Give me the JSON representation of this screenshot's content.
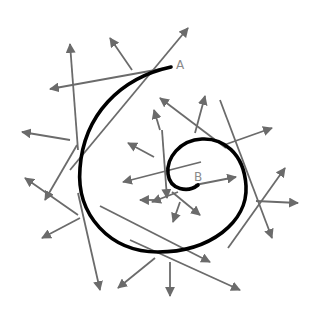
{
  "diagram": {
    "title": "",
    "labels": {
      "start": "A",
      "end": "B"
    },
    "colors": {
      "curve": "#000000",
      "vector": "#6b6b6b",
      "label": "#8a8a8a",
      "background": "#ffffff"
    },
    "curve": {
      "name": "spiral",
      "from": "A",
      "to": "B"
    },
    "vectors": [
      {
        "id": "v1",
        "kind": "tangent"
      },
      {
        "id": "v2",
        "kind": "normal"
      },
      {
        "id": "v3",
        "kind": "tangent"
      },
      {
        "id": "v4",
        "kind": "normal"
      },
      {
        "id": "v5",
        "kind": "normal"
      },
      {
        "id": "v6",
        "kind": "tangent"
      },
      {
        "id": "v7",
        "kind": "normal"
      },
      {
        "id": "v8",
        "kind": "tangent"
      },
      {
        "id": "v9",
        "kind": "normal"
      },
      {
        "id": "v10",
        "kind": "tangent"
      },
      {
        "id": "v11",
        "kind": "normal"
      },
      {
        "id": "v12",
        "kind": "tangent"
      },
      {
        "id": "v13",
        "kind": "normal"
      },
      {
        "id": "v14",
        "kind": "tangent"
      },
      {
        "id": "v15",
        "kind": "normal"
      },
      {
        "id": "v16",
        "kind": "tangent"
      },
      {
        "id": "v17",
        "kind": "normal"
      },
      {
        "id": "v18",
        "kind": "tangent"
      },
      {
        "id": "v19",
        "kind": "normal"
      },
      {
        "id": "v20",
        "kind": "tangent"
      },
      {
        "id": "v21",
        "kind": "normal"
      },
      {
        "id": "v22",
        "kind": "tangent"
      },
      {
        "id": "v23",
        "kind": "normal"
      }
    ]
  }
}
